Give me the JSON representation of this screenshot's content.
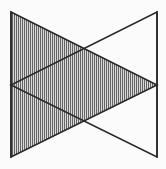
{
  "figure": {
    "type": "line-drawing",
    "canvas": {
      "width": 166,
      "height": 169
    },
    "background_color": "#ffffff",
    "line_color": "#2b2b2b",
    "line_width": 1.6,
    "fill_pattern": "vertical-hatch",
    "hatch_color": "#555555",
    "hatch_spacing_px": 2,
    "hatch_line_width_px": 0.9,
    "hatch_base_fill": "#d8d8d8",
    "vertices": {
      "top_left": {
        "x": 11,
        "y": 12,
        "label": "A"
      },
      "top_right": {
        "x": 157,
        "y": 12,
        "label": "B"
      },
      "mid_left": {
        "x": 11,
        "y": 85,
        "label": "C"
      },
      "mid_right": {
        "x": 157,
        "y": 85,
        "label": "D"
      },
      "bottom_left": {
        "x": 11,
        "y": 157,
        "label": "E"
      },
      "bottom_right": {
        "x": 157,
        "y": 157,
        "label": "F"
      },
      "upper_crossing": {
        "x": 84,
        "y": 48,
        "label": "X1"
      },
      "lower_crossing": {
        "x": 84,
        "y": 120,
        "label": "X2"
      }
    },
    "shapes": [
      {
        "name": "upper-shaded-triangle",
        "description": "Hatched triangle with apex at top-left, base toward mid-right",
        "points": "11,12 157,85 11,157",
        "filled": true
      },
      {
        "name": "lower-outline-triangle",
        "description": "Unfilled triangle with vertical right edge and apex at mid-left",
        "points": "157,12 157,157 11,85",
        "filled": false
      }
    ],
    "edges": [
      {
        "name": "left-vertical-edge",
        "from": "top_left",
        "to": "bottom_left",
        "path": "11,12 11,157"
      },
      {
        "name": "right-vertical-edge",
        "from": "top_right",
        "to": "bottom_right",
        "path": "157,12 157,157"
      },
      {
        "name": "upper-descending-edge",
        "from": "top_left",
        "to": "mid_right",
        "path": "11,12 157,85"
      },
      {
        "name": "lower-ascending-edge",
        "from": "bottom_left",
        "to": "mid_right",
        "path": "11,157 157,85"
      },
      {
        "name": "upper-ascending-edge",
        "from": "mid_left",
        "to": "top_right",
        "path": "11,85 157,12"
      },
      {
        "name": "lower-descending-edge",
        "from": "mid_left",
        "to": "bottom_right",
        "path": "11,85 157,157"
      }
    ],
    "regions": [
      {
        "name": "top-right-white-region",
        "shaded": false
      },
      {
        "name": "bottom-right-white-region",
        "shaded": false
      },
      {
        "name": "left-hatched-region",
        "shaded": true
      },
      {
        "name": "central-hatched-region",
        "shaded": true
      }
    ]
  }
}
